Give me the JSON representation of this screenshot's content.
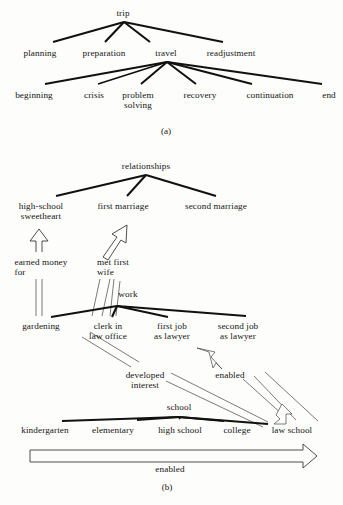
{
  "figure": {
    "panels": [
      {
        "tag": "(a)",
        "x": 166,
        "y": 126
      },
      {
        "tag": "(b)",
        "x": 167,
        "y": 482
      }
    ]
  },
  "panel_a": {
    "nodes": [
      {
        "id": "trip",
        "label": "trip",
        "x": 123,
        "y": 8,
        "level": 1
      },
      {
        "id": "planning",
        "label": "planning",
        "x": 40,
        "y": 48,
        "level": 2
      },
      {
        "id": "preparation",
        "label": "preparation",
        "x": 104,
        "y": 48,
        "level": 2
      },
      {
        "id": "travel",
        "label": "travel",
        "x": 166,
        "y": 48,
        "level": 2
      },
      {
        "id": "readjustment",
        "label": "readjustment",
        "x": 231,
        "y": 48,
        "level": 2
      },
      {
        "id": "beginning",
        "label": "beginning",
        "x": 34,
        "y": 90,
        "level": 3
      },
      {
        "id": "crisis",
        "label": "crisis",
        "x": 94,
        "y": 90,
        "level": 3
      },
      {
        "id": "problem",
        "label": "problem\nsolving",
        "x": 138,
        "y": 90,
        "level": 3
      },
      {
        "id": "recovery",
        "label": "recovery",
        "x": 200,
        "y": 90,
        "level": 3
      },
      {
        "id": "continuation",
        "label": "continuation",
        "x": 270,
        "y": 90,
        "level": 3
      },
      {
        "id": "end",
        "label": "end",
        "x": 329,
        "y": 90,
        "level": 3
      }
    ],
    "edges": [
      {
        "from": "trip",
        "to": "planning"
      },
      {
        "from": "trip",
        "to": "preparation"
      },
      {
        "from": "trip",
        "to": "travel"
      },
      {
        "from": "trip",
        "to": "readjustment"
      },
      {
        "from": "travel",
        "to": "beginning"
      },
      {
        "from": "travel",
        "to": "crisis"
      },
      {
        "from": "travel",
        "to": "problem"
      },
      {
        "from": "travel",
        "to": "recovery"
      },
      {
        "from": "travel",
        "to": "continuation"
      },
      {
        "from": "travel",
        "to": "end"
      }
    ]
  },
  "panel_b": {
    "nodes": [
      {
        "id": "relationships",
        "label": "relationships",
        "x": 146,
        "y": 161
      },
      {
        "id": "sweetheart",
        "label": "high-school\nsweetheart",
        "x": 41,
        "y": 201
      },
      {
        "id": "first_marriage",
        "label": "first marriage",
        "x": 123,
        "y": 201
      },
      {
        "id": "second_marriage",
        "label": "second marriage",
        "x": 216,
        "y": 201
      },
      {
        "id": "earned_money",
        "label": "earned money\nfor",
        "x": 41,
        "y": 257
      },
      {
        "id": "met_first_wife",
        "label": "met first\nwife",
        "x": 113,
        "y": 257
      },
      {
        "id": "work",
        "label": "work",
        "x": 128,
        "y": 289
      },
      {
        "id": "gardening",
        "label": "gardening",
        "x": 41,
        "y": 321
      },
      {
        "id": "clerk",
        "label": "clerk in\nlaw office",
        "x": 108,
        "y": 321
      },
      {
        "id": "first_job",
        "label": "first job\nas lawyer",
        "x": 172,
        "y": 321
      },
      {
        "id": "second_job",
        "label": "second job\nas lawyer",
        "x": 238,
        "y": 321
      },
      {
        "id": "developed",
        "label": "developed\ninterest",
        "x": 145,
        "y": 370
      },
      {
        "id": "enabled_mid",
        "label": "enabled",
        "x": 230,
        "y": 370
      },
      {
        "id": "school",
        "label": "school",
        "x": 179,
        "y": 402
      },
      {
        "id": "kindergarten",
        "label": "kindergarten",
        "x": 45,
        "y": 425
      },
      {
        "id": "elementary",
        "label": "elementary",
        "x": 113,
        "y": 425
      },
      {
        "id": "high_school",
        "label": "high school",
        "x": 180,
        "y": 425
      },
      {
        "id": "college",
        "label": "college",
        "x": 237,
        "y": 425
      },
      {
        "id": "law_school",
        "label": "law school",
        "x": 292,
        "y": 425
      },
      {
        "id": "enabled_bottom",
        "label": "enabled",
        "x": 170,
        "y": 464
      }
    ],
    "edges": [
      {
        "from": "relationships",
        "to": "sweetheart"
      },
      {
        "from": "relationships",
        "to": "first_marriage"
      },
      {
        "from": "relationships",
        "to": "second_marriage"
      },
      {
        "from": "work",
        "to": "gardening"
      },
      {
        "from": "work",
        "to": "clerk"
      },
      {
        "from": "work",
        "to": "first_job"
      },
      {
        "from": "work",
        "to": "second_job"
      },
      {
        "from": "school",
        "to": "kindergarten"
      },
      {
        "from": "school",
        "to": "elementary"
      },
      {
        "from": "school",
        "to": "high_school"
      },
      {
        "from": "school",
        "to": "college"
      },
      {
        "from": "school",
        "to": "law_school"
      }
    ],
    "relations": [
      {
        "label": "earned money for",
        "from": "gardening",
        "to": "sweetheart",
        "style": "hollow-arrow-vertical"
      },
      {
        "label": "met first wife",
        "from": "clerk",
        "to": "first_marriage",
        "style": "hollow-arrow-slanted"
      },
      {
        "label": "developed interest",
        "from": "clerk",
        "to": "law_school",
        "style": "thin-arrow"
      },
      {
        "label": "enabled",
        "from": "law_school",
        "to": "second_job",
        "style": "hollow-arrow-small"
      },
      {
        "label": "enabled",
        "from": "kindergarten",
        "to": "law_school",
        "style": "big-hollow-arrow"
      }
    ]
  },
  "colors": {
    "ink": "#141414",
    "paper": "#fdfdfb",
    "edge": "#111111",
    "thin": "#333333"
  }
}
